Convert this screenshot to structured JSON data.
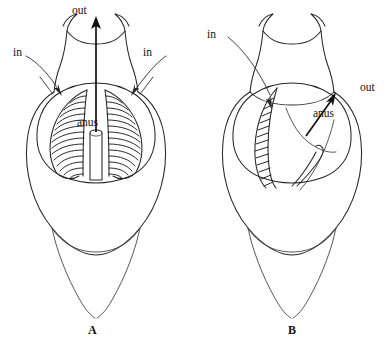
{
  "figure": {
    "background_color": "#ffffff",
    "ink_color": "#262626",
    "panels": [
      {
        "id": "A",
        "caption": "A",
        "view": "frontal view with symmetric pharyngeal basket",
        "labels": {
          "out": "out",
          "in_left": "in",
          "in_right": "in",
          "anus": "anus"
        }
      },
      {
        "id": "B",
        "caption": "B",
        "view": "oblique view with single lateral gill band",
        "labels": {
          "out": "out",
          "in_left": "in",
          "anus": "anus"
        }
      }
    ]
  }
}
